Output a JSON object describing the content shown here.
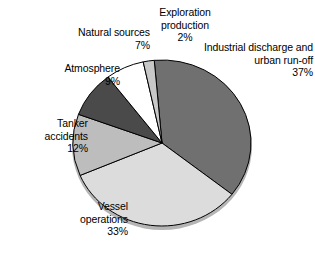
{
  "chart_data": {
    "type": "pie",
    "title": "",
    "subtitle": "",
    "xlabel": "",
    "ylabel": "",
    "legend_position": "none",
    "grid": false,
    "units": "percent",
    "total": 100,
    "start_angle_deg": -5,
    "direction": "clockwise",
    "categories": [
      "Industrial discharge and urban run-off",
      "Vessel operations",
      "Tanker accidents",
      "Atmosphere",
      "Natural sources",
      "Exploration production"
    ],
    "values": [
      37,
      33,
      12,
      9,
      7,
      2
    ],
    "slices": [
      {
        "name": "Industrial discharge and urban run-off",
        "value": 37,
        "value_label": "37%",
        "color": "#707070",
        "label_line1": "Industrial discharge and",
        "label_line2": "urban run-off"
      },
      {
        "name": "Vessel operations",
        "value": 33,
        "value_label": "33%",
        "color": "#dcdcdc",
        "label_line1": "Vessel",
        "label_line2": "operations"
      },
      {
        "name": "Tanker accidents",
        "value": 12,
        "value_label": "12%",
        "color": "#bdbdbd",
        "label_line1": "Tanker",
        "label_line2": "accidents"
      },
      {
        "name": "Atmosphere",
        "value": 9,
        "value_label": "9%",
        "color": "#4a4a4a",
        "label_line1": "Atmosphere",
        "label_line2": ""
      },
      {
        "name": "Natural sources",
        "value": 7,
        "value_label": "7%",
        "color": "#ffffff",
        "label_line1": "Natural sources",
        "label_line2": ""
      },
      {
        "name": "Exploration production",
        "value": 2,
        "value_label": "2%",
        "color": "#c8c8c8",
        "label_line1": "Exploration",
        "label_line2": "production"
      }
    ]
  },
  "labels": {
    "exploration": "Exploration\nproduction\n2%",
    "industrial": "Industrial discharge and\nurban run-off\n37%",
    "natural": "Natural sources\n7%",
    "atmosphere": "Atmosphere\n9%",
    "tanker": "Tanker\naccidents\n12%",
    "vessel": "Vessel\noperations\n33%"
  },
  "style": {
    "background": "#ffffff",
    "outline": "#000000",
    "shadow": "#b5b5b5",
    "text": "#000000"
  }
}
